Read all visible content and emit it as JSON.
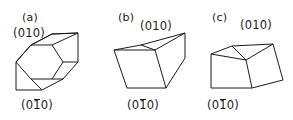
{
  "figure": {
    "background_color": "#ffffff",
    "stroke_color": "#1a1a1a",
    "width": 293,
    "height": 120
  },
  "panels": [
    {
      "id": "a",
      "panel_label": "(a)",
      "top_face_label": "(010)",
      "bottom_face_label_prefix": "(0",
      "bottom_face_label_bar_digit": "1",
      "bottom_face_label_suffix": "0)",
      "shape": "hexagonal-prism",
      "outline_points": "16,62 31,45 52,34 78,33 78,62 63,79 42,90 16,90",
      "edges": [
        "16,62 42,62 63,45 78,33",
        "42,62 42,90",
        "42,62 31,45",
        "63,45 31,45",
        "63,45 63,79",
        "63,79 78,62"
      ]
    },
    {
      "id": "b",
      "panel_label": "(b)",
      "top_face_label": "(010)",
      "bottom_face_label_prefix": "(0",
      "bottom_face_label_bar_digit": "1",
      "bottom_face_label_suffix": "0)",
      "shape": "trapezoidal-prism",
      "outline_points": "114,50 141,45 185,33 185,58 166,88 127,88",
      "edges": [
        "114,50 155,50 185,33",
        "155,50 166,88",
        "155,50 141,45"
      ]
    },
    {
      "id": "c",
      "panel_label": "(c)",
      "top_face_label": "(010)",
      "bottom_face_label_prefix": "(0",
      "bottom_face_label_bar_digit": "1",
      "bottom_face_label_suffix": "0)",
      "shape": "truncated-prism",
      "outline_points": "211,54 232,46 273,44 283,80 252,88 211,88 211,54",
      "edges": [
        "211,54 246,60 273,44",
        "246,60 252,88",
        "246,60 232,46"
      ]
    }
  ]
}
